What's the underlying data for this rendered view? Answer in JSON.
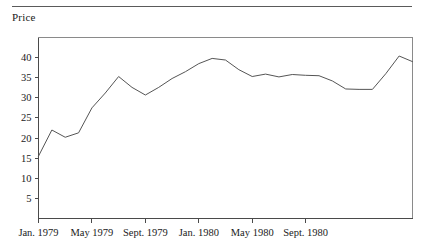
{
  "figure": {
    "ylabel": "Price",
    "has_top_rule": true
  },
  "chart_data": {
    "type": "line",
    "title": "",
    "xlabel": "",
    "ylabel": "Price",
    "grid": false,
    "legend": false,
    "ylim": [
      0,
      45
    ],
    "ytick_values": [
      5,
      10,
      15,
      20,
      25,
      30,
      35,
      40
    ],
    "ytick_labels": [
      "5",
      "10",
      "15",
      "20",
      "25",
      "30",
      "35",
      "40"
    ],
    "xtick_labels": [
      "Jan. 1979",
      "May 1979",
      "Sept. 1979",
      "Jan. 1980",
      "May 1980",
      "Sept. 1980"
    ],
    "xtick_indices": [
      0,
      4,
      8,
      12,
      16,
      20
    ],
    "x": [
      "Jan. 1979",
      "Feb. 1979",
      "Mar. 1979",
      "Apr. 1979",
      "May 1979",
      "June 1979",
      "July 1979",
      "Aug. 1979",
      "Sept. 1979",
      "Oct. 1979",
      "Nov. 1979",
      "Dec. 1979",
      "Jan. 1980",
      "Feb. 1980",
      "Mar. 1980",
      "Apr. 1980",
      "May 1980",
      "June 1980",
      "July 1980",
      "Aug. 1980",
      "Sept. 1980",
      "Oct. 1980",
      "Nov. 1980",
      "Dec. 1980"
    ],
    "values": [
      15.5,
      22.0,
      20.2,
      21.3,
      27.5,
      31.2,
      35.3,
      32.6,
      30.7,
      32.6,
      34.8,
      36.5,
      38.5,
      39.8,
      39.4,
      37.0,
      35.3,
      35.9,
      35.2,
      35.8,
      35.6,
      35.5,
      34.2,
      32.2
    ],
    "tail_values": [
      32.1,
      32.1,
      36.0,
      40.4,
      39.0
    ],
    "series_name": "Price"
  }
}
